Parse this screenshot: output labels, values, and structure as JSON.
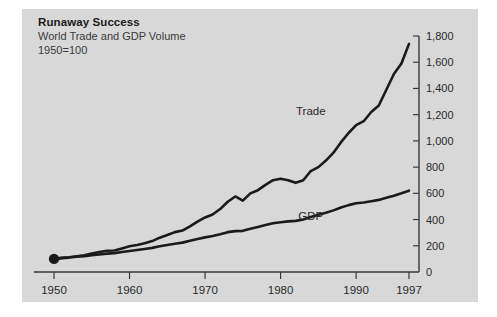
{
  "header": {
    "title": "Runaway Success",
    "subtitle": "World Trade and GDP Volume",
    "note": "1950=100"
  },
  "colors": {
    "panel_background": "#d8d8d8",
    "page_background": "#ffffff",
    "axis": "#3a3a3a",
    "line": "#1a1a1a",
    "text": "#2a2a2a"
  },
  "chart_data": {
    "type": "line",
    "title": "Runaway Success",
    "subtitle": "World Trade and GDP Volume",
    "note": "1950=100",
    "xlabel": "",
    "ylabel": "",
    "xlim": [
      1950,
      1997
    ],
    "ylim": [
      0,
      1800
    ],
    "ytick_step": 200,
    "grid": false,
    "legend_position": "inline-labels",
    "y_axis_side": "right",
    "x_ticks": [
      1950,
      1960,
      1970,
      1980,
      1990,
      1997
    ],
    "x_tick_labels": [
      "1950",
      "1960",
      "1970",
      "1980",
      "1990",
      "1997"
    ],
    "y_ticks": [
      0,
      200,
      400,
      600,
      800,
      1000,
      1200,
      1400,
      1600,
      1800
    ],
    "y_tick_labels": [
      "0",
      "200",
      "400",
      "600",
      "800",
      "1,000",
      "1,200",
      "1,400",
      "1,600",
      "1,800"
    ],
    "start_marker": {
      "x": 1950,
      "y": 100,
      "label": "1950=100"
    },
    "series": [
      {
        "name": "Trade",
        "label": "Trade",
        "label_x": 1984,
        "label_y": 1200,
        "x": [
          1950,
          1951,
          1952,
          1953,
          1954,
          1955,
          1956,
          1957,
          1958,
          1959,
          1960,
          1961,
          1962,
          1963,
          1964,
          1965,
          1966,
          1967,
          1968,
          1969,
          1970,
          1971,
          1972,
          1973,
          1974,
          1975,
          1976,
          1977,
          1978,
          1979,
          1980,
          1981,
          1982,
          1983,
          1984,
          1985,
          1986,
          1987,
          1988,
          1989,
          1990,
          1991,
          1992,
          1993,
          1994,
          1995,
          1996,
          1997
        ],
        "values": [
          100,
          108,
          112,
          120,
          128,
          140,
          152,
          162,
          164,
          180,
          196,
          206,
          220,
          236,
          262,
          282,
          304,
          316,
          348,
          384,
          416,
          438,
          480,
          536,
          576,
          544,
          600,
          624,
          664,
          700,
          712,
          700,
          680,
          700,
          770,
          800,
          850,
          910,
          990,
          1060,
          1120,
          1150,
          1220,
          1270,
          1390,
          1510,
          1590,
          1740
        ]
      },
      {
        "name": "GDP",
        "label": "GDP",
        "label_x": 1984,
        "label_y": 400,
        "x": [
          1950,
          1951,
          1952,
          1953,
          1954,
          1955,
          1956,
          1957,
          1958,
          1959,
          1960,
          1961,
          1962,
          1963,
          1964,
          1965,
          1966,
          1967,
          1968,
          1969,
          1970,
          1971,
          1972,
          1973,
          1974,
          1975,
          1976,
          1977,
          1978,
          1979,
          1980,
          1981,
          1982,
          1983,
          1984,
          1985,
          1986,
          1987,
          1988,
          1989,
          1990,
          1991,
          1992,
          1993,
          1994,
          1995,
          1996,
          1997
        ],
        "values": [
          100,
          106,
          110,
          116,
          120,
          128,
          134,
          140,
          144,
          152,
          160,
          168,
          176,
          184,
          196,
          206,
          216,
          224,
          238,
          252,
          264,
          274,
          288,
          304,
          312,
          314,
          330,
          344,
          358,
          372,
          380,
          386,
          390,
          400,
          420,
          436,
          452,
          470,
          492,
          510,
          524,
          530,
          540,
          550,
          566,
          582,
          600,
          620
        ]
      }
    ]
  }
}
